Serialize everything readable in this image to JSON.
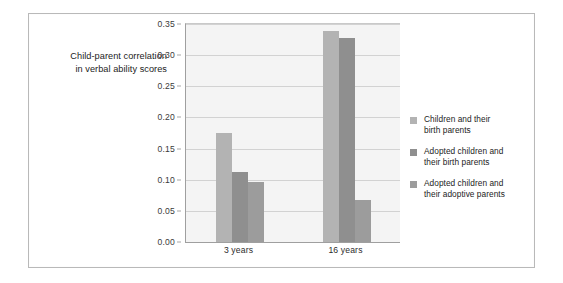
{
  "figure": {
    "frame_color": "#b9b9b9",
    "background": "#ffffff"
  },
  "title": {
    "line1": "Child-parent correlation",
    "line2": "in verbal ability scores"
  },
  "legend": {
    "position": "right",
    "entries": [
      {
        "swatch_color": "#b3b3b3",
        "line1": "Children and their",
        "line2": "birth parents"
      },
      {
        "swatch_color": "#8f8f8f",
        "line1": "Adopted children and",
        "line2": "their birth parents"
      },
      {
        "swatch_color": "#9c9c9c",
        "line1": "Adopted children and",
        "line2": "their adoptive parents"
      }
    ]
  },
  "chart_data": {
    "type": "bar",
    "title": "Child-parent correlation in verbal ability scores",
    "xlabel": "",
    "ylabel": "",
    "categories": [
      "3 years",
      "16 years"
    ],
    "ylim": [
      0.0,
      0.35
    ],
    "yticks": [
      0.0,
      0.05,
      0.1,
      0.15,
      0.2,
      0.25,
      0.3,
      0.35
    ],
    "ytick_labels": [
      "0.00",
      "0.05",
      "0.10",
      "0.15",
      "0.20",
      "0.25",
      "0.30",
      "0.35"
    ],
    "grid": true,
    "grid_axis": "y",
    "legend_position": "right",
    "series": [
      {
        "name": "Children and their birth parents",
        "color": "#b3b3b3",
        "values": [
          0.175,
          0.338
        ]
      },
      {
        "name": "Adopted children and their birth parents",
        "color": "#8f8f8f",
        "values": [
          0.112,
          0.328
        ]
      },
      {
        "name": "Adopted children and their adoptive parents",
        "color": "#9c9c9c",
        "values": [
          0.097,
          0.068
        ]
      }
    ]
  }
}
